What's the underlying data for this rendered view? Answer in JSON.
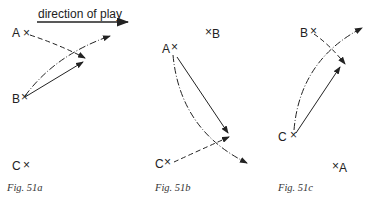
{
  "header": {
    "direction_label": "direction of play"
  },
  "figures": [
    {
      "caption": "Fig. 51a",
      "players": [
        {
          "label": "A",
          "marker": "×"
        },
        {
          "label": "B",
          "marker": "×"
        },
        {
          "label": "C",
          "marker": "×"
        }
      ]
    },
    {
      "caption": "Fig. 51b",
      "players": [
        {
          "label": "A",
          "marker": "×"
        },
        {
          "label": "B",
          "marker": "×"
        },
        {
          "label": "C",
          "marker": "×"
        }
      ]
    },
    {
      "caption": "Fig. 51c",
      "players": [
        {
          "label": "A",
          "marker": "×"
        },
        {
          "label": "B",
          "marker": "×"
        },
        {
          "label": "C",
          "marker": "×"
        }
      ]
    }
  ],
  "legend": {
    "solid_line": "pass",
    "dashed_line": "player run",
    "dash_dot_line": "ball path"
  },
  "colors": {
    "ink": "#222222",
    "background": "#ffffff"
  }
}
